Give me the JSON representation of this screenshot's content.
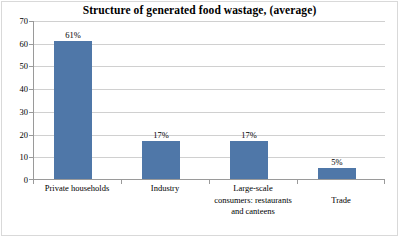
{
  "chart_data": {
    "type": "bar",
    "title": "Structure of generated food wastage, (average)",
    "xlabel": "",
    "ylabel": "",
    "categories": [
      "Private households",
      "Industry",
      "Large-scale consumers: restaurants and canteens",
      "Trade"
    ],
    "category_lines": [
      [
        "Private households"
      ],
      [
        "Industry"
      ],
      [
        "Large-scale",
        "consumers: restaurants",
        "and canteens"
      ],
      [
        "Trade"
      ]
    ],
    "values": [
      61,
      17,
      17,
      5
    ],
    "data_labels": [
      "61%",
      "17%",
      "17%",
      "5%"
    ],
    "ylim": [
      0,
      70
    ],
    "y_ticks": [
      0,
      10,
      20,
      30,
      40,
      50,
      60,
      70
    ],
    "y_tick_labels": [
      "0",
      "10",
      "20",
      "30",
      "40",
      "50",
      "60",
      "70"
    ],
    "grid": true,
    "legend": false,
    "series_color": "#4f77a8",
    "gridline_color": "#d0d0d0",
    "axis_color": "#9a9a9a"
  }
}
